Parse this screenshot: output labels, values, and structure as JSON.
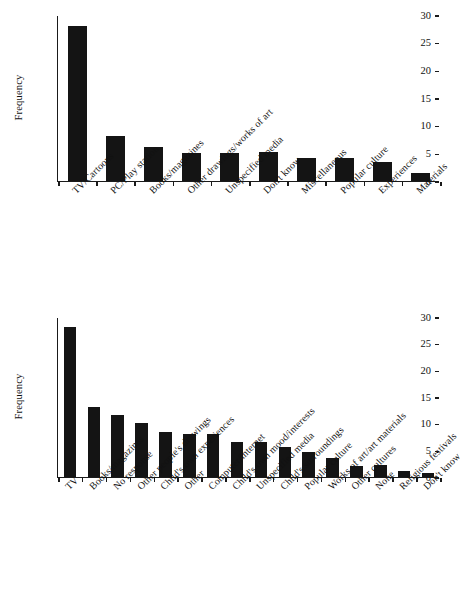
{
  "chart_data": [
    {
      "id": "top",
      "type": "bar",
      "title": "",
      "xlabel": "",
      "ylabel": "Frequency",
      "ylim": [
        0,
        30
      ],
      "yticks": [
        0,
        5,
        10,
        15,
        20,
        25,
        30
      ],
      "grid": false,
      "legend": "none",
      "bar_color": "#141414",
      "categories": [
        "TV/Cartoons",
        "PC/Play station",
        "Books/magazines",
        "Other drawings/works of art",
        "Unspecified media",
        "Don't know",
        "Miscellaneous",
        "Popular culture",
        "Experiences",
        "Materials"
      ],
      "values": [
        28.1,
        8.1,
        6.2,
        5.1,
        5.1,
        5.2,
        4.1,
        4.1,
        3.4,
        1.4
      ]
    },
    {
      "id": "bottom",
      "type": "bar",
      "title": "",
      "xlabel": "",
      "ylabel": "Frequency",
      "ylim": [
        0,
        30
      ],
      "yticks": [
        0,
        5,
        10,
        15,
        20,
        25,
        30
      ],
      "grid": false,
      "legend": "none",
      "bar_color": "#141414",
      "categories": [
        "TV",
        "Books/magazines",
        "No response",
        "Other people's drawings",
        "Child's own experiences",
        "Other",
        "Computer/internet",
        "Child's own mood/interests",
        "Unspecified media",
        "Child's surroundings",
        "Popular culture",
        "Works of art/art materials",
        "Other cultures",
        "None",
        "Religious festivals",
        "Don't know"
      ],
      "values": [
        28.2,
        13.1,
        11.6,
        10.1,
        8.5,
        8.0,
        8.1,
        6.6,
        6.6,
        5.6,
        4.7,
        3.6,
        2.1,
        2.2,
        1.2,
        0.7
      ]
    }
  ]
}
